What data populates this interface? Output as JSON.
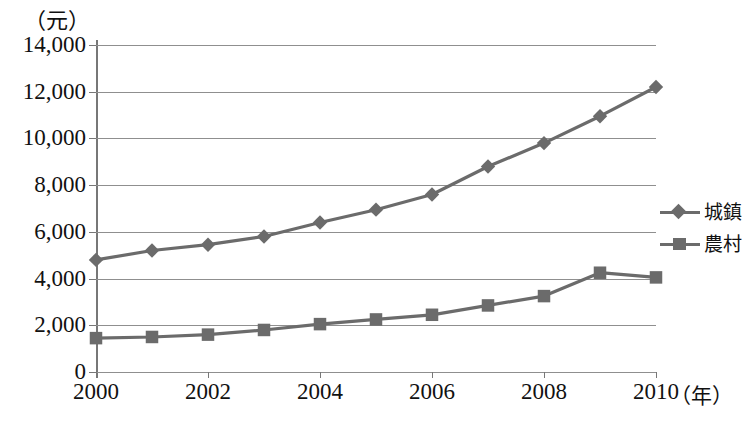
{
  "chart_data": {
    "type": "line",
    "title": "",
    "xlabel": "（年）",
    "ylabel": "（元）",
    "x": [
      2000,
      2001,
      2002,
      2003,
      2004,
      2005,
      2006,
      2007,
      2008,
      2009,
      2010
    ],
    "xtick_labels": [
      "2000",
      "2002",
      "2004",
      "2006",
      "2008",
      "2010"
    ],
    "xticks": [
      2000,
      2002,
      2004,
      2006,
      2008,
      2010
    ],
    "ytick_labels": [
      "0",
      "2,000",
      "4,000",
      "6,000",
      "8,000",
      "10,000",
      "12,000",
      "14,000"
    ],
    "yticks": [
      0,
      2000,
      4000,
      6000,
      8000,
      10000,
      12000,
      14000
    ],
    "ylim": [
      0,
      14000
    ],
    "xlim": [
      2000,
      2010
    ],
    "grid": true,
    "legend_position": "right",
    "series": [
      {
        "name": "城鎮",
        "marker": "diamond",
        "color": "#6b6b6b",
        "values": [
          4800,
          5200,
          5450,
          5800,
          6400,
          6950,
          7600,
          8800,
          9800,
          10950,
          12200
        ]
      },
      {
        "name": "農村",
        "marker": "square",
        "color": "#6b6b6b",
        "values": [
          1450,
          1500,
          1600,
          1800,
          2050,
          2250,
          2450,
          2850,
          3250,
          4250,
          4050
        ]
      }
    ]
  },
  "legend": {
    "entries": [
      {
        "label": "城鎮",
        "marker": "diamond"
      },
      {
        "label": "農村",
        "marker": "square"
      }
    ]
  },
  "axes": {
    "y_unit": "（元）",
    "x_unit": "（年）"
  },
  "colors": {
    "series": "#6b6b6b",
    "grid": "#8f8f8f",
    "axis": "#777777",
    "text": "#111111",
    "background": "#ffffff"
  }
}
